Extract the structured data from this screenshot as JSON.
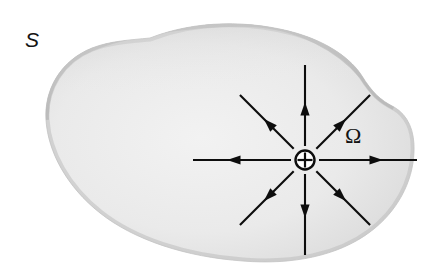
{
  "figure": {
    "kind": "physics-diagram",
    "canvas": {
      "width": 432,
      "height": 267,
      "background": "#ffffff"
    },
    "surface": {
      "name": "closed-surface-blob",
      "label": "S",
      "label_x": 32,
      "label_y": 47,
      "fill_color": "#e9e9e9",
      "edge_shade_color": "#c9c9c9",
      "outline_color": "#d2d2d2"
    },
    "region": {
      "name": "enclosed-region",
      "label": "Ω",
      "label_x": 345,
      "label_y": 143
    },
    "charge": {
      "name": "point-charge",
      "symbol": "⊕",
      "polarity": "positive",
      "center_x": 305,
      "center_y": 160,
      "radius": 9.5,
      "color": "#0d0d0d"
    },
    "field": {
      "direction": "outward",
      "arrow_count": 8,
      "color": "#0d0d0d",
      "arrows": [
        {
          "name": "field-arrow-right",
          "angle_deg": 0,
          "inner": 14,
          "outer": 112,
          "head_at": 78
        },
        {
          "name": "field-arrow-up-right",
          "angle_deg": 315,
          "inner": 16,
          "outer": 92,
          "head_at": 58
        },
        {
          "name": "field-arrow-up",
          "angle_deg": 270,
          "inner": 14,
          "outer": 95,
          "head_at": 58
        },
        {
          "name": "field-arrow-up-left",
          "angle_deg": 225,
          "inner": 16,
          "outer": 92,
          "head_at": 58
        },
        {
          "name": "field-arrow-left",
          "angle_deg": 180,
          "inner": 14,
          "outer": 112,
          "head_at": 78
        },
        {
          "name": "field-arrow-down-left",
          "angle_deg": 135,
          "inner": 16,
          "outer": 92,
          "head_at": 58
        },
        {
          "name": "field-arrow-down",
          "angle_deg": 90,
          "inner": 14,
          "outer": 95,
          "head_at": 58
        },
        {
          "name": "field-arrow-down-right",
          "angle_deg": 45,
          "inner": 16,
          "outer": 92,
          "head_at": 58
        }
      ]
    }
  }
}
